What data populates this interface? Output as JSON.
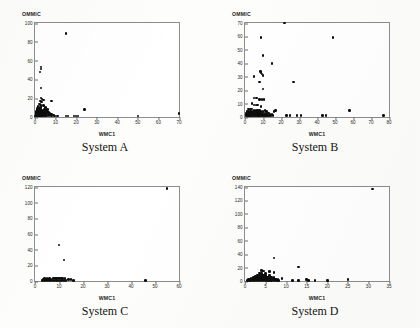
{
  "figure": {
    "background": "#fdfdfb",
    "point_color": "#0d0d0d",
    "axis_color": "#8d8d8d"
  },
  "panels": [
    {
      "caption": "System A",
      "xlabel": "WMC1",
      "ylabel": "OMMIC"
    },
    {
      "caption": "System B",
      "xlabel": "WMC1",
      "ylabel": "OMMIC"
    },
    {
      "caption": "System C",
      "xlabel": "WMC1",
      "ylabel": "OMMIC"
    },
    {
      "caption": "System D",
      "xlabel": "WMC1",
      "ylabel": "OMMIC"
    }
  ],
  "chart_data": [
    {
      "type": "scatter",
      "title": "System A",
      "xlabel": "WMC1",
      "ylabel": "OMMIC",
      "xlim": [
        0,
        70
      ],
      "ylim": [
        0,
        100
      ],
      "xticks": [
        0,
        10,
        20,
        30,
        40,
        50,
        60,
        70
      ],
      "yticks": [
        0,
        20,
        40,
        60,
        80,
        100
      ],
      "grid": false,
      "legend": null,
      "points": [
        [
          15,
          89
        ],
        [
          3,
          53
        ],
        [
          3,
          51
        ],
        [
          2.5,
          48
        ],
        [
          3,
          31
        ],
        [
          3,
          20
        ],
        [
          3.5,
          19
        ],
        [
          4,
          18
        ],
        [
          2.8,
          17
        ],
        [
          3.2,
          16
        ],
        [
          8,
          17
        ],
        [
          2,
          14
        ],
        [
          2.5,
          13
        ],
        [
          3,
          12
        ],
        [
          4,
          12
        ],
        [
          1.5,
          11
        ],
        [
          2,
          10
        ],
        [
          3,
          10
        ],
        [
          5,
          10
        ],
        [
          1.2,
          9
        ],
        [
          2.2,
          9
        ],
        [
          1,
          8
        ],
        [
          2,
          8
        ],
        [
          3,
          8
        ],
        [
          4.5,
          8
        ],
        [
          6,
          8
        ],
        [
          1,
          7
        ],
        [
          1.8,
          7
        ],
        [
          2.6,
          7
        ],
        [
          3.4,
          7
        ],
        [
          5,
          7
        ],
        [
          0.8,
          6
        ],
        [
          1.6,
          6
        ],
        [
          2.4,
          6
        ],
        [
          3.2,
          6
        ],
        [
          4,
          6
        ],
        [
          5.5,
          6
        ],
        [
          0.7,
          5
        ],
        [
          1.4,
          5
        ],
        [
          2.1,
          5
        ],
        [
          2.8,
          5
        ],
        [
          3.6,
          5
        ],
        [
          4.4,
          5
        ],
        [
          6.5,
          5
        ],
        [
          0.6,
          4
        ],
        [
          1.2,
          4
        ],
        [
          1.9,
          4
        ],
        [
          2.6,
          4
        ],
        [
          3.3,
          4
        ],
        [
          4.2,
          4
        ],
        [
          5.2,
          4
        ],
        [
          7,
          4
        ],
        [
          0.5,
          3
        ],
        [
          1,
          3
        ],
        [
          1.6,
          3
        ],
        [
          2.2,
          3
        ],
        [
          2.9,
          3
        ],
        [
          3.6,
          3
        ],
        [
          4.4,
          3
        ],
        [
          5.4,
          3
        ],
        [
          6.4,
          3
        ],
        [
          8,
          3
        ],
        [
          0.4,
          2
        ],
        [
          0.9,
          2
        ],
        [
          1.4,
          2
        ],
        [
          2,
          2
        ],
        [
          2.6,
          2
        ],
        [
          3.2,
          2
        ],
        [
          3.9,
          2
        ],
        [
          4.6,
          2
        ],
        [
          5.5,
          2
        ],
        [
          6.6,
          2
        ],
        [
          7.6,
          2
        ],
        [
          9,
          2
        ],
        [
          0.3,
          1
        ],
        [
          0.7,
          1
        ],
        [
          1.1,
          1
        ],
        [
          1.6,
          1
        ],
        [
          2.1,
          1
        ],
        [
          2.6,
          1
        ],
        [
          3.1,
          1
        ],
        [
          3.7,
          1
        ],
        [
          4.3,
          1
        ],
        [
          5,
          1
        ],
        [
          5.8,
          1
        ],
        [
          6.8,
          1
        ],
        [
          8,
          1
        ],
        [
          9.5,
          1
        ],
        [
          11,
          1
        ],
        [
          15,
          1
        ],
        [
          16,
          1
        ],
        [
          19,
          1
        ],
        [
          20,
          1
        ],
        [
          21,
          1
        ],
        [
          24,
          8
        ],
        [
          50,
          1
        ],
        [
          70,
          4
        ]
      ]
    },
    {
      "type": "scatter",
      "title": "System B",
      "xlabel": "WMC1",
      "ylabel": "OMMIC",
      "xlim": [
        0,
        80
      ],
      "ylim": [
        0,
        70
      ],
      "xticks": [
        0,
        10,
        20,
        30,
        40,
        50,
        60,
        70,
        80
      ],
      "yticks": [
        0,
        10,
        20,
        30,
        40,
        50,
        60,
        70
      ],
      "grid": false,
      "legend": null,
      "points": [
        [
          22,
          70
        ],
        [
          9,
          59
        ],
        [
          49,
          59
        ],
        [
          10,
          46
        ],
        [
          15,
          40
        ],
        [
          8.5,
          34
        ],
        [
          9,
          33
        ],
        [
          9.5,
          32
        ],
        [
          10,
          31
        ],
        [
          5,
          30
        ],
        [
          8,
          26
        ],
        [
          27,
          26
        ],
        [
          10,
          21
        ],
        [
          5,
          14
        ],
        [
          6.5,
          14
        ],
        [
          8,
          13
        ],
        [
          9.5,
          13
        ],
        [
          10.5,
          13
        ],
        [
          4,
          10
        ],
        [
          5,
          9
        ],
        [
          6,
          9
        ],
        [
          7,
          9
        ],
        [
          9,
          8
        ],
        [
          2,
          6
        ],
        [
          3,
          6
        ],
        [
          4,
          6
        ],
        [
          5,
          5
        ],
        [
          6,
          5
        ],
        [
          7,
          5
        ],
        [
          8,
          5
        ],
        [
          11,
          5
        ],
        [
          17,
          5
        ],
        [
          1,
          4
        ],
        [
          2,
          4
        ],
        [
          3,
          4
        ],
        [
          4,
          4
        ],
        [
          5,
          4
        ],
        [
          6,
          4
        ],
        [
          7,
          4
        ],
        [
          8,
          4
        ],
        [
          9,
          4
        ],
        [
          10,
          4
        ],
        [
          12,
          4
        ],
        [
          16,
          4
        ],
        [
          0.8,
          3
        ],
        [
          1.6,
          3
        ],
        [
          2.4,
          3
        ],
        [
          3.2,
          3
        ],
        [
          4,
          3
        ],
        [
          4.8,
          3
        ],
        [
          5.6,
          3
        ],
        [
          6.4,
          3
        ],
        [
          7.2,
          3
        ],
        [
          8,
          3
        ],
        [
          9,
          3
        ],
        [
          10,
          3
        ],
        [
          11,
          3
        ],
        [
          13,
          3
        ],
        [
          0.6,
          2
        ],
        [
          1.2,
          2
        ],
        [
          1.8,
          2
        ],
        [
          2.5,
          2
        ],
        [
          3.2,
          2
        ],
        [
          3.9,
          2
        ],
        [
          4.6,
          2
        ],
        [
          5.3,
          2
        ],
        [
          6,
          2
        ],
        [
          6.8,
          2
        ],
        [
          7.6,
          2
        ],
        [
          8.4,
          2
        ],
        [
          9.2,
          2
        ],
        [
          10,
          2
        ],
        [
          11,
          2
        ],
        [
          12,
          2
        ],
        [
          14,
          2
        ],
        [
          15,
          2
        ],
        [
          0.5,
          1
        ],
        [
          1,
          1
        ],
        [
          1.5,
          1
        ],
        [
          2,
          1
        ],
        [
          2.6,
          1
        ],
        [
          3.2,
          1
        ],
        [
          3.8,
          1
        ],
        [
          4.4,
          1
        ],
        [
          5,
          1
        ],
        [
          5.6,
          1
        ],
        [
          6.2,
          1
        ],
        [
          6.8,
          1
        ],
        [
          7.5,
          1
        ],
        [
          8.2,
          1
        ],
        [
          9,
          1
        ],
        [
          9.8,
          1
        ],
        [
          10.6,
          1
        ],
        [
          11.5,
          1
        ],
        [
          12.5,
          1
        ],
        [
          13.5,
          1
        ],
        [
          14.5,
          1
        ],
        [
          15.5,
          1
        ],
        [
          23,
          1
        ],
        [
          25,
          1
        ],
        [
          29,
          1
        ],
        [
          31,
          1
        ],
        [
          43,
          1
        ],
        [
          45,
          1
        ],
        [
          58,
          5
        ],
        [
          77,
          1
        ]
      ]
    },
    {
      "type": "scatter",
      "title": "System C",
      "xlabel": "WMC1",
      "ylabel": "OMMIC",
      "xlim": [
        0,
        60
      ],
      "ylim": [
        0,
        120
      ],
      "xticks": [
        0,
        10,
        20,
        30,
        40,
        50,
        60
      ],
      "yticks": [
        0,
        20,
        40,
        60,
        80,
        100,
        120
      ],
      "grid": false,
      "legend": null,
      "points": [
        [
          55,
          118
        ],
        [
          10,
          46
        ],
        [
          12,
          27
        ],
        [
          4,
          3
        ],
        [
          5,
          3
        ],
        [
          6,
          3
        ],
        [
          8,
          4
        ],
        [
          9,
          4
        ],
        [
          10,
          4
        ],
        [
          11,
          4
        ],
        [
          3.5,
          2
        ],
        [
          4.5,
          2
        ],
        [
          5.5,
          2
        ],
        [
          6.5,
          2
        ],
        [
          7.5,
          3
        ],
        [
          8.5,
          3
        ],
        [
          9.5,
          3
        ],
        [
          10.5,
          3
        ],
        [
          11.5,
          3
        ],
        [
          12.5,
          3
        ],
        [
          3,
          1
        ],
        [
          4,
          1
        ],
        [
          5,
          1
        ],
        [
          6,
          1
        ],
        [
          7,
          1
        ],
        [
          8,
          1
        ],
        [
          9,
          1
        ],
        [
          10,
          1
        ],
        [
          11,
          1
        ],
        [
          12,
          1
        ],
        [
          13,
          1
        ],
        [
          14,
          2
        ],
        [
          15,
          2
        ],
        [
          16,
          1
        ],
        [
          46,
          1
        ]
      ]
    },
    {
      "type": "scatter",
      "title": "System D",
      "xlabel": "WMC1",
      "ylabel": "OMMIC",
      "xlim": [
        0,
        35
      ],
      "ylim": [
        0,
        140
      ],
      "xticks": [
        0,
        5,
        10,
        15,
        20,
        25,
        30,
        35
      ],
      "yticks": [
        0,
        20,
        40,
        60,
        80,
        100,
        120,
        140
      ],
      "grid": false,
      "legend": null,
      "points": [
        [
          31,
          137
        ],
        [
          7,
          34
        ],
        [
          13,
          21
        ],
        [
          4,
          16
        ],
        [
          4.5,
          15
        ],
        [
          6,
          14
        ],
        [
          7,
          13
        ],
        [
          3.5,
          12
        ],
        [
          4,
          11
        ],
        [
          5,
          11
        ],
        [
          3,
          9
        ],
        [
          3.5,
          9
        ],
        [
          4,
          9
        ],
        [
          4.5,
          8
        ],
        [
          5,
          8
        ],
        [
          6,
          8
        ],
        [
          2.5,
          7
        ],
        [
          3,
          7
        ],
        [
          3.5,
          6
        ],
        [
          4,
          6
        ],
        [
          4.5,
          6
        ],
        [
          5,
          6
        ],
        [
          5.5,
          6
        ],
        [
          6.5,
          6
        ],
        [
          2,
          5
        ],
        [
          2.5,
          5
        ],
        [
          3,
          5
        ],
        [
          3.5,
          5
        ],
        [
          4,
          5
        ],
        [
          4.5,
          5
        ],
        [
          5,
          5
        ],
        [
          5.5,
          5
        ],
        [
          6,
          5
        ],
        [
          7,
          5
        ],
        [
          1.5,
          4
        ],
        [
          2,
          4
        ],
        [
          2.5,
          4
        ],
        [
          3,
          4
        ],
        [
          3.5,
          4
        ],
        [
          4,
          4
        ],
        [
          4.5,
          4
        ],
        [
          5,
          4
        ],
        [
          5.5,
          4
        ],
        [
          6,
          4
        ],
        [
          6.5,
          4
        ],
        [
          7,
          4
        ],
        [
          1,
          3
        ],
        [
          1.5,
          3
        ],
        [
          2,
          3
        ],
        [
          2.5,
          3
        ],
        [
          3,
          3
        ],
        [
          3.5,
          3
        ],
        [
          4,
          3
        ],
        [
          4.5,
          3
        ],
        [
          5,
          3
        ],
        [
          5.5,
          3
        ],
        [
          6,
          3
        ],
        [
          6.5,
          3
        ],
        [
          7,
          3
        ],
        [
          7.5,
          3
        ],
        [
          0.8,
          2
        ],
        [
          1.2,
          2
        ],
        [
          1.7,
          2
        ],
        [
          2.2,
          2
        ],
        [
          2.7,
          2
        ],
        [
          3.2,
          2
        ],
        [
          3.7,
          2
        ],
        [
          4.2,
          2
        ],
        [
          4.7,
          2
        ],
        [
          5.2,
          2
        ],
        [
          5.7,
          2
        ],
        [
          6.2,
          2
        ],
        [
          6.8,
          2
        ],
        [
          7.4,
          2
        ],
        [
          8,
          2
        ],
        [
          0.6,
          1
        ],
        [
          1,
          1
        ],
        [
          1.4,
          1
        ],
        [
          1.9,
          1
        ],
        [
          2.4,
          1
        ],
        [
          2.9,
          1
        ],
        [
          3.4,
          1
        ],
        [
          3.9,
          1
        ],
        [
          4.4,
          1
        ],
        [
          4.9,
          1
        ],
        [
          5.4,
          1
        ],
        [
          5.9,
          1
        ],
        [
          6.4,
          1
        ],
        [
          7,
          1
        ],
        [
          7.6,
          1
        ],
        [
          8.2,
          1
        ],
        [
          9,
          4
        ],
        [
          11.5,
          1
        ],
        [
          13,
          1
        ],
        [
          15,
          2
        ],
        [
          15.5,
          1
        ],
        [
          17,
          1
        ],
        [
          20,
          1
        ],
        [
          25,
          2
        ]
      ]
    }
  ]
}
